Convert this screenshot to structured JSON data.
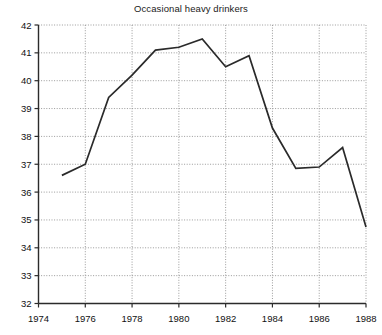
{
  "chart_data": {
    "type": "line",
    "title": "Occasional heavy drinkers",
    "xlabel": "",
    "ylabel": "",
    "x": [
      1975,
      1976,
      1977,
      1978,
      1979,
      1980,
      1981,
      1982,
      1983,
      1984,
      1985,
      1986,
      1987,
      1988
    ],
    "values": [
      36.6,
      37.0,
      39.4,
      40.2,
      41.1,
      41.2,
      41.5,
      40.5,
      40.9,
      38.3,
      36.85,
      36.9,
      37.6,
      34.75
    ],
    "series": [
      {
        "name": "Occasional heavy drinkers",
        "values": [
          36.6,
          37.0,
          39.4,
          40.2,
          41.1,
          41.2,
          41.5,
          40.5,
          40.9,
          38.3,
          36.85,
          36.9,
          37.6,
          34.75
        ]
      }
    ],
    "xlim": [
      1974,
      1988
    ],
    "ylim": [
      32,
      42
    ],
    "xticks": [
      1974,
      1976,
      1978,
      1980,
      1982,
      1984,
      1986,
      1988
    ],
    "yticks": [
      32,
      33,
      34,
      35,
      36,
      37,
      38,
      39,
      40,
      41,
      42
    ],
    "xticklabels": [
      "1974",
      "1976",
      "1978",
      "1980",
      "1982",
      "1984",
      "1986",
      "1988"
    ],
    "yticklabels": [
      "32",
      "33",
      "34",
      "35",
      "36",
      "37",
      "38",
      "39",
      "40",
      "41",
      "42"
    ],
    "grid": true,
    "grid_style": "dotted",
    "legend": null,
    "legend_position": "none",
    "line_color": "#2a2a2a",
    "grid_color": "#9a9a9a",
    "axis_color": "#2b2b2b",
    "background_color": "#ffffff"
  }
}
